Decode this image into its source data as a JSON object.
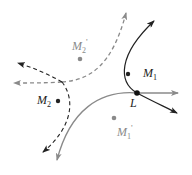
{
  "diagram": {
    "colors": {
      "dark": "#222222",
      "gray": "#8a8a8a",
      "background": "#ffffff"
    },
    "points": [
      {
        "id": "M1",
        "label": "M",
        "sub": "1",
        "prime": "",
        "x": 128,
        "y": 74,
        "color": "dark"
      },
      {
        "id": "M2",
        "label": "M",
        "sub": "2",
        "prime": "",
        "x": 58,
        "y": 101,
        "color": "dark"
      },
      {
        "id": "M1p",
        "label": "M",
        "sub": "1",
        "prime": "'",
        "x": 114,
        "y": 118,
        "color": "gray"
      },
      {
        "id": "M2p",
        "label": "M",
        "sub": "2",
        "prime": "'",
        "x": 80,
        "y": 59,
        "color": "gray"
      },
      {
        "id": "L",
        "label": "L",
        "sub": "",
        "prime": "",
        "x": 137,
        "y": 93,
        "color": "dark"
      }
    ],
    "curves": [
      {
        "id": "dashed-gray",
        "style": "dashed",
        "color": "gray"
      },
      {
        "id": "dashed-dark",
        "style": "dashed",
        "color": "dark"
      },
      {
        "id": "solid-dark",
        "style": "solid",
        "color": "dark"
      },
      {
        "id": "solid-gray",
        "style": "solid",
        "color": "gray"
      }
    ]
  },
  "labels": {
    "M1": "M",
    "M1_sub": "1",
    "M2": "M",
    "M2_sub": "2",
    "M1p": "M",
    "M1p_sub": "1",
    "M1p_prime": "'",
    "M2p": "M",
    "M2p_sub": "2",
    "M2p_prime": "'",
    "L": "L"
  }
}
